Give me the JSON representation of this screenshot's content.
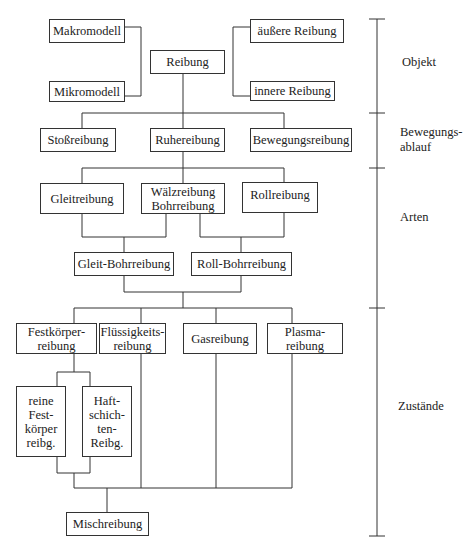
{
  "diagram": {
    "title": "",
    "nodes": {
      "makromodell": "Makromodell",
      "mikromodell": "Mikromodell",
      "reibung": "Reibung",
      "aeussere_reibung": "äußere Reibung",
      "innere_reibung": "innere Reibung",
      "stossreibung": "Stoßreibung",
      "ruhereibung": "Ruhereibung",
      "bewegungsreibung": "Bewegungsreibung",
      "gleitreibung": "Gleitreibung",
      "waelz_bohrreibung": "Wälzreibung\nBohrreibung",
      "rollreibung": "Rollreibung",
      "gleit_bohrreibung": "Gleit-Bohrreibung",
      "roll_bohrreibung": "Roll-Bohrreibung",
      "festkoerperreibung": "Festkörper-\nreibung",
      "fluessigkeitsreibung": "Flüssigkeits-\nreibung",
      "gasreibung": "Gasreibung",
      "plasmareibung": "Plasma-\nreibung",
      "reine_festkoerperreibung": "reine\nFest-\nkörper\nreibg.",
      "haftschichtenreibung": "Haft-\nschich-\nten-\nReibg.",
      "mischreibung": "Mischreibung"
    },
    "scale_labels": {
      "objekt": "Objekt",
      "bewegungsablauf": "Bewegungs-\nablauf",
      "arten": "Arten",
      "zustaende": "Zustände"
    },
    "colors": {
      "line": "#333333",
      "background": "#ffffff"
    }
  }
}
